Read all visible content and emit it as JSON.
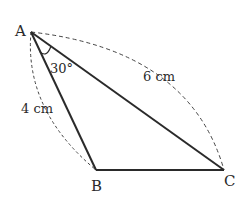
{
  "diagram": {
    "type": "triangle",
    "vertices": {
      "A": {
        "label": "A"
      },
      "B": {
        "label": "B"
      },
      "C": {
        "label": "C"
      }
    },
    "angle_label": "30°",
    "side_labels": {
      "AC": "6 cm",
      "AB": "4 cm"
    },
    "colors": {
      "line": "#2a2a2a",
      "background": "#ffffff"
    }
  }
}
